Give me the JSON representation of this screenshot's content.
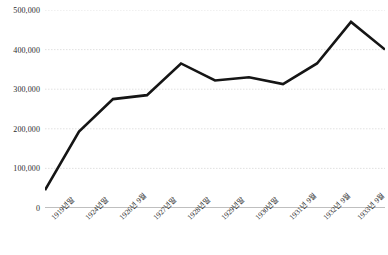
{
  "chart_data": {
    "type": "line",
    "title": "",
    "subtitle": "",
    "xlabel": "",
    "ylabel": "",
    "grid": true,
    "legend": false,
    "legend_position": "none",
    "line_color": "#151515",
    "grid_color": "#d9d9d9",
    "axis_color": "#7f7f7f",
    "ylim": [
      0,
      500000
    ],
    "ytick_labels": [
      "0",
      "100,000",
      "200,000",
      "300,000",
      "400,000",
      "500,000"
    ],
    "ytick_values": [
      0,
      100000,
      200000,
      300000,
      400000,
      500000
    ],
    "categories": [
      "1919년말",
      "1924년말",
      "1926년 9월",
      "1927년말",
      "1928년말",
      "1929년말",
      "1930년말",
      "1931년 9월",
      "1932년 9월",
      "1933년 9월",
      "1934년 9월"
    ],
    "values": [
      45000,
      193000,
      275000,
      285000,
      365000,
      322000,
      330000,
      313000,
      365000,
      470000,
      400000
    ]
  }
}
